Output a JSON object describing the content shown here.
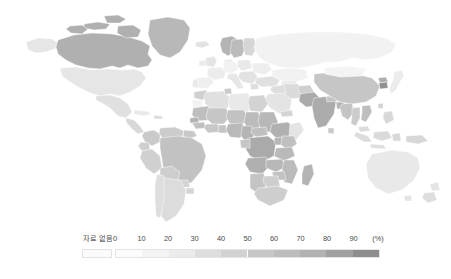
{
  "figure": {
    "type": "choropleth-world-map",
    "background_color": "#ffffff"
  },
  "legend": {
    "nodata_label": "자료 없음",
    "nodata_color": "#fbfbfb",
    "unit_label": "(%)",
    "tick_labels": [
      "0",
      "10",
      "20",
      "30",
      "40",
      "50",
      "60",
      "70",
      "80",
      "90"
    ],
    "tick_values": [
      0,
      10,
      20,
      30,
      40,
      50,
      60,
      70,
      80,
      90
    ],
    "bar_colors": [
      "#fcfcfc",
      "#f4f4f4",
      "#ebebeb",
      "#dddddd",
      "#d2d2d2",
      "#c7c7c7",
      "#bdbdbd",
      "#b2b2b2",
      "#a0a0a0",
      "#8e8e8e"
    ]
  },
  "chart_data": {
    "type": "heatmap",
    "title": "",
    "subtitle": "",
    "xlabel": "",
    "ylabel": "",
    "legend_position": "bottom",
    "grid": false,
    "value_unit": "(%)",
    "value_range": [
      0,
      90
    ],
    "nodata_label": "자료 없음",
    "color_scale": [
      {
        "stop": 0,
        "color": "#fcfcfc"
      },
      {
        "stop": 10,
        "color": "#f4f4f4"
      },
      {
        "stop": 20,
        "color": "#ebebeb"
      },
      {
        "stop": 30,
        "color": "#dddddd"
      },
      {
        "stop": 40,
        "color": "#d2d2d2"
      },
      {
        "stop": 50,
        "color": "#c7c7c7"
      },
      {
        "stop": 60,
        "color": "#bdbdbd"
      },
      {
        "stop": 70,
        "color": "#b2b2b2"
      },
      {
        "stop": 80,
        "color": "#a0a0a0"
      },
      {
        "stop": 90,
        "color": "#8e8e8e"
      }
    ],
    "regions": [
      {
        "name": "Greenland",
        "value": 62,
        "color": "#b8b8b8"
      },
      {
        "name": "Canada",
        "value": 66,
        "color": "#b0b0b0"
      },
      {
        "name": "United States",
        "value": 22,
        "color": "#e6e6e6"
      },
      {
        "name": "Mexico",
        "value": 26,
        "color": "#e0e0e0"
      },
      {
        "name": "Central America",
        "value": 34,
        "color": "#d8d8d8"
      },
      {
        "name": "Cuba",
        "value": 20,
        "color": "#e9e9e9"
      },
      {
        "name": "Colombia",
        "value": 46,
        "color": "#cacaca"
      },
      {
        "name": "Venezuela",
        "value": 44,
        "color": "#cccccc"
      },
      {
        "name": "Brazil",
        "value": 52,
        "color": "#c2c2c2"
      },
      {
        "name": "Peru",
        "value": 40,
        "color": "#d0d0d0"
      },
      {
        "name": "Bolivia",
        "value": 42,
        "color": "#cecece"
      },
      {
        "name": "Chile",
        "value": 28,
        "color": "#dedede"
      },
      {
        "name": "Argentina",
        "value": 30,
        "color": "#dcdcdc"
      },
      {
        "name": "United Kingdom",
        "value": 24,
        "color": "#e4e4e4"
      },
      {
        "name": "Norway",
        "value": 64,
        "color": "#b4b4b4"
      },
      {
        "name": "Sweden",
        "value": 58,
        "color": "#bbbbbb"
      },
      {
        "name": "Finland",
        "value": 36,
        "color": "#d6d6d6"
      },
      {
        "name": "France",
        "value": 18,
        "color": "#ececec"
      },
      {
        "name": "Spain",
        "value": 16,
        "color": "#efefef"
      },
      {
        "name": "Germany",
        "value": 14,
        "color": "#f1f1f1"
      },
      {
        "name": "Poland",
        "value": 20,
        "color": "#e9e9e9"
      },
      {
        "name": "Italy",
        "value": 22,
        "color": "#e6e6e6"
      },
      {
        "name": "Russia",
        "value": 12,
        "color": "#f2f2f2"
      },
      {
        "name": "Turkey",
        "value": 26,
        "color": "#e0e0e0"
      },
      {
        "name": "Iran",
        "value": 32,
        "color": "#dadada"
      },
      {
        "name": "Saudi Arabia",
        "value": 24,
        "color": "#e4e4e4"
      },
      {
        "name": "Kazakhstan",
        "value": 14,
        "color": "#f1f1f1"
      },
      {
        "name": "Pakistan",
        "value": 70,
        "color": "#aaaaaa"
      },
      {
        "name": "India",
        "value": 68,
        "color": "#acacac"
      },
      {
        "name": "China",
        "value": 48,
        "color": "#c6c6c6"
      },
      {
        "name": "Mongolia",
        "value": 10,
        "color": "#f4f4f4"
      },
      {
        "name": "Japan",
        "value": 18,
        "color": "#ececec"
      },
      {
        "name": "South Korea",
        "value": 86,
        "color": "#909090"
      },
      {
        "name": "Myanmar",
        "value": 50,
        "color": "#c4c4c4"
      },
      {
        "name": "Thailand",
        "value": 44,
        "color": "#cccccc"
      },
      {
        "name": "Vietnam",
        "value": 56,
        "color": "#bebebe"
      },
      {
        "name": "Indonesia",
        "value": 30,
        "color": "#dcdcdc"
      },
      {
        "name": "Philippines",
        "value": 34,
        "color": "#d8d8d8"
      },
      {
        "name": "Morocco",
        "value": 40,
        "color": "#d0d0d0"
      },
      {
        "name": "Algeria",
        "value": 26,
        "color": "#e0e0e0"
      },
      {
        "name": "Libya",
        "value": 20,
        "color": "#e9e9e9"
      },
      {
        "name": "Egypt",
        "value": 38,
        "color": "#d3d3d3"
      },
      {
        "name": "Mauritania",
        "value": 56,
        "color": "#bebebe"
      },
      {
        "name": "Mali",
        "value": 48,
        "color": "#c6c6c6"
      },
      {
        "name": "Niger",
        "value": 52,
        "color": "#c2c2c2"
      },
      {
        "name": "Chad",
        "value": 58,
        "color": "#bbbbbb"
      },
      {
        "name": "Sudan",
        "value": 62,
        "color": "#b8b8b8"
      },
      {
        "name": "Ethiopia",
        "value": 66,
        "color": "#b0b0b0"
      },
      {
        "name": "Nigeria",
        "value": 60,
        "color": "#b9b9b9"
      },
      {
        "name": "Cameroon",
        "value": 64,
        "color": "#b4b4b4"
      },
      {
        "name": "DR Congo",
        "value": 70,
        "color": "#aaaaaa"
      },
      {
        "name": "Kenya",
        "value": 54,
        "color": "#c0c0c0"
      },
      {
        "name": "Tanzania",
        "value": 60,
        "color": "#b9b9b9"
      },
      {
        "name": "Angola",
        "value": 66,
        "color": "#b0b0b0"
      },
      {
        "name": "Zambia",
        "value": 62,
        "color": "#b8b8b8"
      },
      {
        "name": "Mozambique",
        "value": 58,
        "color": "#bbbbbb"
      },
      {
        "name": "Madagascar",
        "value": 64,
        "color": "#b4b4b4"
      },
      {
        "name": "South Africa",
        "value": 42,
        "color": "#cecece"
      },
      {
        "name": "Namibia",
        "value": 50,
        "color": "#c4c4c4"
      },
      {
        "name": "Australia",
        "value": 20,
        "color": "#e9e9e9"
      },
      {
        "name": "New Zealand",
        "value": 24,
        "color": "#e4e4e4"
      },
      {
        "name": "Papua New Guinea",
        "value": 34,
        "color": "#d8d8d8"
      }
    ]
  }
}
